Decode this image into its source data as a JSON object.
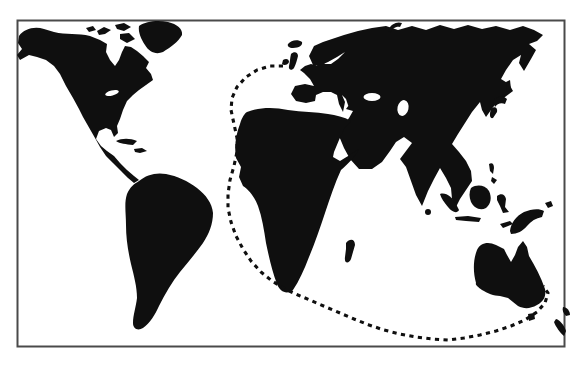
{
  "figure": {
    "kind": "world-map-silhouette",
    "background_color": "#ffffff",
    "ink_color": "#0f0f0f",
    "frame_color": "#4a4a4a",
    "landmasses": [
      "north-america",
      "arctic-islands",
      "greenland",
      "cuba",
      "hispaniola",
      "south-america",
      "iceland",
      "ireland",
      "great-britain",
      "eurasia",
      "novaya-zemlya",
      "africa",
      "madagascar",
      "sri-lanka",
      "sakhalin",
      "japan",
      "philippines",
      "sumatra",
      "java",
      "borneo",
      "sulawesi",
      "timor",
      "new-guinea",
      "bismarck-islands",
      "australia",
      "tasmania",
      "new-zealand-north-island",
      "new-zealand-south-island"
    ],
    "water_bodies": [
      "black-sea",
      "caspian-sea",
      "great-lakes"
    ],
    "route": {
      "style": "dashed",
      "color": "#0f0f0f",
      "dash": "4.2 4.4",
      "width": 3.1,
      "from": "british-isles",
      "to": "southeast-australia",
      "points": [
        [
          283,
          66
        ],
        [
          270,
          66
        ],
        [
          257,
          70
        ],
        [
          246,
          77
        ],
        [
          237,
          87
        ],
        [
          232,
          98
        ],
        [
          231,
          110
        ],
        [
          234,
          124
        ],
        [
          237,
          138
        ],
        [
          237,
          152
        ],
        [
          234,
          166
        ],
        [
          230,
          180
        ],
        [
          228,
          194
        ],
        [
          228,
          208
        ],
        [
          231,
          222
        ],
        [
          236,
          236
        ],
        [
          243,
          249
        ],
        [
          251,
          261
        ],
        [
          261,
          272
        ],
        [
          272,
          281
        ],
        [
          285,
          289
        ],
        [
          298,
          295
        ],
        [
          312,
          301
        ],
        [
          326,
          307
        ],
        [
          340,
          313
        ],
        [
          354,
          319
        ],
        [
          369,
          325
        ],
        [
          384,
          330
        ],
        [
          400,
          334
        ],
        [
          416,
          337
        ],
        [
          432,
          339
        ],
        [
          448,
          340
        ],
        [
          464,
          338
        ],
        [
          480,
          335
        ],
        [
          496,
          331
        ],
        [
          511,
          326
        ],
        [
          525,
          320
        ],
        [
          537,
          312
        ],
        [
          545,
          303
        ],
        [
          548,
          293
        ],
        [
          543,
          286
        ]
      ]
    }
  }
}
